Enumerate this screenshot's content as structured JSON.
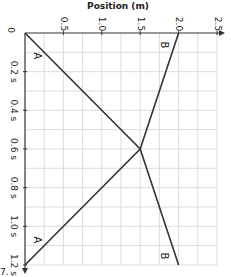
{
  "chart_data": {
    "type": "line",
    "orientation": "rotated-90",
    "title": "",
    "xlabel": "Time (s)",
    "ylabel": "Position (m)",
    "position_axis_label": "Position (m)",
    "position_ticks": [
      "0",
      "0.5",
      "1.0",
      "1.5",
      "2.0",
      "2.5"
    ],
    "time_ticks": [
      "0.2 s",
      "0.4 s",
      "0.6 s",
      "0.8 s",
      "1.0 s",
      "1.2 s"
    ],
    "origin_label": "0",
    "xlim": [
      0,
      1.2
    ],
    "ylim": [
      0,
      2.5
    ],
    "grid": true,
    "series": [
      {
        "name": "A",
        "x": [
          0,
          0.6,
          1.2
        ],
        "values": [
          0,
          1.5,
          0
        ]
      },
      {
        "name": "B",
        "x": [
          0,
          0.6,
          1.2
        ],
        "values": [
          2.0,
          1.5,
          2.0
        ]
      }
    ],
    "annotations": [
      "A",
      "A",
      "B",
      "B"
    ],
    "corner_text": "7."
  }
}
